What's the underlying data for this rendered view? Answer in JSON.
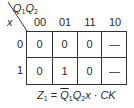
{
  "kmap": {
    "var_top": "Q1Q2",
    "var_top_parts": [
      "Q",
      "1",
      "Q",
      "2"
    ],
    "var_side": "x",
    "column_headers": [
      "00",
      "01",
      "11",
      "10"
    ],
    "row_headers": [
      "0",
      "1"
    ],
    "cells": [
      [
        "0",
        "0",
        "0",
        "—"
      ],
      [
        "0",
        "1",
        "0",
        "—"
      ]
    ]
  },
  "equation": {
    "text": "Z1 = Q̄1Q2x · CK",
    "lhs": "Z",
    "lhs_sub": "1",
    "eq": " = ",
    "t1": "Q",
    "t1_sub": "1",
    "t2": "Q",
    "t2_sub": "2",
    "t3": "x · CK"
  }
}
